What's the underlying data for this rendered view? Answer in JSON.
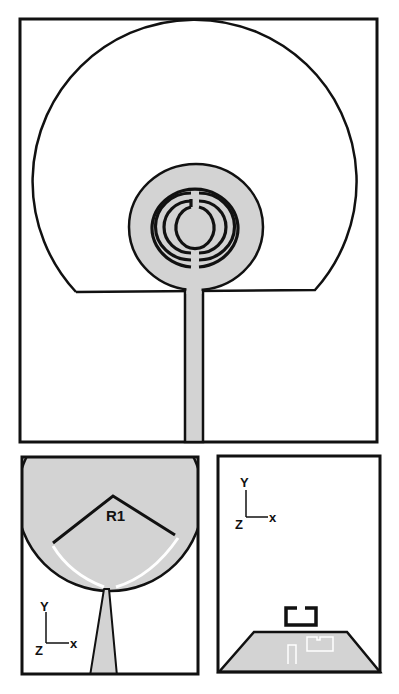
{
  "colors": {
    "conductor": "#d3d3d3",
    "outline": "#111111",
    "slot": "#ffffff",
    "background": "#ffffff"
  },
  "panels": {
    "top": {
      "description": "Antenna top view: truncated outer circular ground boundary, inner circular patch with concentric split-ring slots, microstrip feed line"
    },
    "bottom_left": {
      "description": "Zoomed patch with tapered feed and radius dimension",
      "dimension_label": "R1",
      "axis": {
        "y": "Y",
        "x": "x",
        "z": "Z"
      }
    },
    "bottom_right": {
      "description": "Ground plane trapezoid with bracket-shaped slot and white slot outlines",
      "axis": {
        "y": "Y",
        "x": "x",
        "z": "Z"
      }
    }
  }
}
